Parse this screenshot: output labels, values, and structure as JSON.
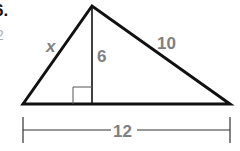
{
  "problem": {
    "number": "6.",
    "sub_label": "2"
  },
  "figure": {
    "type": "triangle-with-altitude",
    "labels": {
      "left_side": "x",
      "altitude": "6",
      "right_side": "10",
      "base": "12"
    },
    "vertices": {
      "left": [
        23,
        104
      ],
      "apex": [
        92,
        6
      ],
      "right": [
        230,
        104
      ],
      "foot": [
        92,
        104
      ]
    },
    "colors": {
      "lines": "#111111",
      "labels": "#808080"
    }
  }
}
